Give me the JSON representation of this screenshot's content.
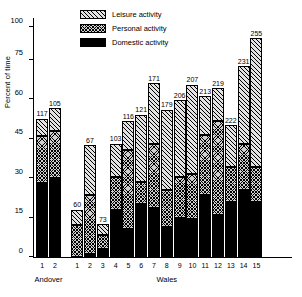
{
  "chart_data": {
    "type": "bar",
    "subtype": "stacked-bar-grouped",
    "title": "",
    "xlabel": "",
    "ylabel": "Percent of time",
    "ylim": [
      0,
      100
    ],
    "yticks": [
      0,
      15,
      30,
      45,
      60,
      75,
      100
    ],
    "grid": false,
    "legend_position": "top-center",
    "series": [
      {
        "name": "Leisure activity",
        "key": "leisure",
        "fill": "diagonal-hatch",
        "values": [
          6.5,
          8.5,
          6.0,
          19.0,
          4.0,
          12.5,
          11.0,
          25.5,
          23.0,
          30.5,
          29.0,
          34.0,
          14.5,
          12.5,
          16.0,
          29.5,
          57.5
        ]
      },
      {
        "name": "Personal activity",
        "key": "personal",
        "fill": "cross-hatch",
        "values": [
          18.0,
          18.0,
          12.0,
          22.5,
          5.5,
          12.5,
          30.0,
          8.5,
          24.5,
          14.0,
          15.5,
          17.0,
          23.0,
          35.5,
          13.0,
          17.5,
          13.0
        ]
      },
      {
        "name": "Domestic activity",
        "key": "domestic",
        "fill": "solid-black",
        "values": [
          28.0,
          30.0,
          0.0,
          1.0,
          3.0,
          18.0,
          10.5,
          20.0,
          18.5,
          11.5,
          15.0,
          14.5,
          23.5,
          16.0,
          21.0,
          25.5,
          21.0
        ]
      }
    ],
    "bars": [
      {
        "group": "Andover",
        "category": "1",
        "label": "117",
        "domestic": 28.0,
        "personal": 18.0,
        "leisure": 6.5
      },
      {
        "group": "Andover",
        "category": "2",
        "label": "105",
        "domestic": 30.0,
        "personal": 18.0,
        "leisure": 8.5
      },
      {
        "group": "Wales",
        "category": "1",
        "label": "60",
        "domestic": 0.0,
        "personal": 12.0,
        "leisure": 6.0
      },
      {
        "group": "Wales",
        "category": "2",
        "label": "67",
        "domestic": 1.0,
        "personal": 22.5,
        "leisure": 19.0
      },
      {
        "group": "Wales",
        "category": "3",
        "label": "73",
        "domestic": 3.0,
        "personal": 5.5,
        "leisure": 4.0
      },
      {
        "group": "Wales",
        "category": "4",
        "label": "103",
        "domestic": 18.0,
        "personal": 12.5,
        "leisure": 12.5
      },
      {
        "group": "Wales",
        "category": "5",
        "label": "116",
        "domestic": 10.5,
        "personal": 30.0,
        "leisure": 11.0
      },
      {
        "group": "Wales",
        "category": "6",
        "label": "121",
        "domestic": 20.0,
        "personal": 8.5,
        "leisure": 25.5
      },
      {
        "group": "Wales",
        "category": "7",
        "label": "171",
        "domestic": 18.5,
        "personal": 24.5,
        "leisure": 23.0
      },
      {
        "group": "Wales",
        "category": "8",
        "label": "179",
        "domestic": 11.5,
        "personal": 14.0,
        "leisure": 30.5
      },
      {
        "group": "Wales",
        "category": "9",
        "label": "206",
        "domestic": 15.0,
        "personal": 15.5,
        "leisure": 29.0
      },
      {
        "group": "Wales",
        "category": "10",
        "label": "207",
        "domestic": 14.5,
        "personal": 17.0,
        "leisure": 34.0
      },
      {
        "group": "Wales",
        "category": "11",
        "label": "213",
        "domestic": 23.5,
        "personal": 23.0,
        "leisure": 14.5
      },
      {
        "group": "Wales",
        "category": "12",
        "label": "219",
        "domestic": 16.0,
        "personal": 35.5,
        "leisure": 12.5
      },
      {
        "group": "Wales",
        "category": "13",
        "label": "222",
        "domestic": 21.0,
        "personal": 13.0,
        "leisure": 16.0
      },
      {
        "group": "Wales",
        "category": "14",
        "label": "231",
        "domestic": 25.5,
        "personal": 17.5,
        "leisure": 29.5
      },
      {
        "group": "Wales",
        "category": "15",
        "label": "255",
        "domestic": 21.0,
        "personal": 13.0,
        "leisure": 57.5
      }
    ],
    "groups": [
      {
        "name": "Andover",
        "start_index": 0,
        "end_index": 1
      },
      {
        "name": "Wales",
        "start_index": 2,
        "end_index": 16
      }
    ]
  },
  "legend": {
    "items": [
      {
        "label": "Leisure activity",
        "key": "leisure"
      },
      {
        "label": "Personal activity",
        "key": "personal"
      },
      {
        "label": "Domestic activity",
        "key": "domestic"
      }
    ]
  }
}
